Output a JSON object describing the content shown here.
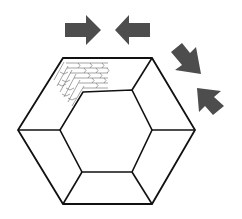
{
  "diagram": {
    "title": "Hexagonal frame with compressive force arrows and brick texture detail",
    "colors": {
      "background": "#ffffff",
      "line": "#111111",
      "arrow": "#4d4d4d",
      "brick": "#666666"
    },
    "outer_hexagon": [
      [
        63,
        58
      ],
      [
        152,
        58
      ],
      [
        195,
        130
      ],
      [
        152,
        204
      ],
      [
        63,
        204
      ],
      [
        18,
        130
      ]
    ],
    "inner_hexagon": [
      [
        83,
        92
      ],
      [
        132,
        90
      ],
      [
        152,
        130
      ],
      [
        132,
        172
      ],
      [
        82,
        172
      ],
      [
        60,
        130
      ]
    ],
    "arrows": [
      {
        "name": "arrow-right",
        "direction": "right",
        "label": "compression-arrow-top-left"
      },
      {
        "name": "arrow-left",
        "direction": "left",
        "label": "compression-arrow-top-right"
      },
      {
        "name": "arrow-down-right",
        "direction": "down-right",
        "label": "compression-arrow-right-upper"
      },
      {
        "name": "arrow-up-left",
        "direction": "up-left",
        "label": "compression-arrow-right-lower"
      }
    ],
    "detail": {
      "name": "brick-pattern",
      "location": "top-left corner of frame"
    }
  }
}
